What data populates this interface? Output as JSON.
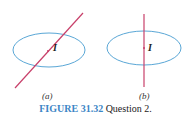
{
  "figure_a": {
    "label": "(a)",
    "current_label": "I",
    "wire": "tilted"
  },
  "figure_b": {
    "label": "(b)",
    "current_label": "I",
    "wire": "perpendicular"
  },
  "caption": {
    "figure_number": "FIGURE 31.32",
    "text": "Question 2."
  },
  "colors": {
    "loop": "#5aa7d6",
    "wire": "#c8406a",
    "caption_accent": "#3d86c6"
  }
}
